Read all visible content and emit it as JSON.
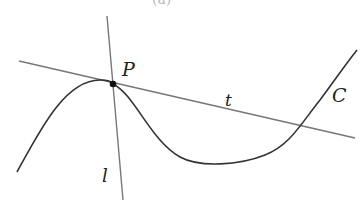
{
  "figure": {
    "caption_fragment": "(a)",
    "labels": {
      "point": "P",
      "tangent": "t",
      "normal": "l",
      "curve": "C"
    },
    "colors": {
      "curve": "#333333",
      "lines": "#777777",
      "point": "#111111",
      "text": "#222222",
      "background": "#ffffff"
    },
    "geometry": {
      "point_P": [
        113,
        84
      ],
      "tangent_line": [
        [
          19,
          61
        ],
        [
          355,
          138
        ]
      ],
      "normal_line": [
        [
          107,
          16
        ],
        [
          123,
          200
        ]
      ],
      "curve_path": "M 17 172 C 40 130, 65 80, 100 80 C 108 80, 112 82, 113 84 C 135 95, 150 140, 180 157 C 200 168, 240 165, 265 155 C 290 145, 300 125, 320 100 C 335 80, 345 65, 357 50"
    }
  }
}
